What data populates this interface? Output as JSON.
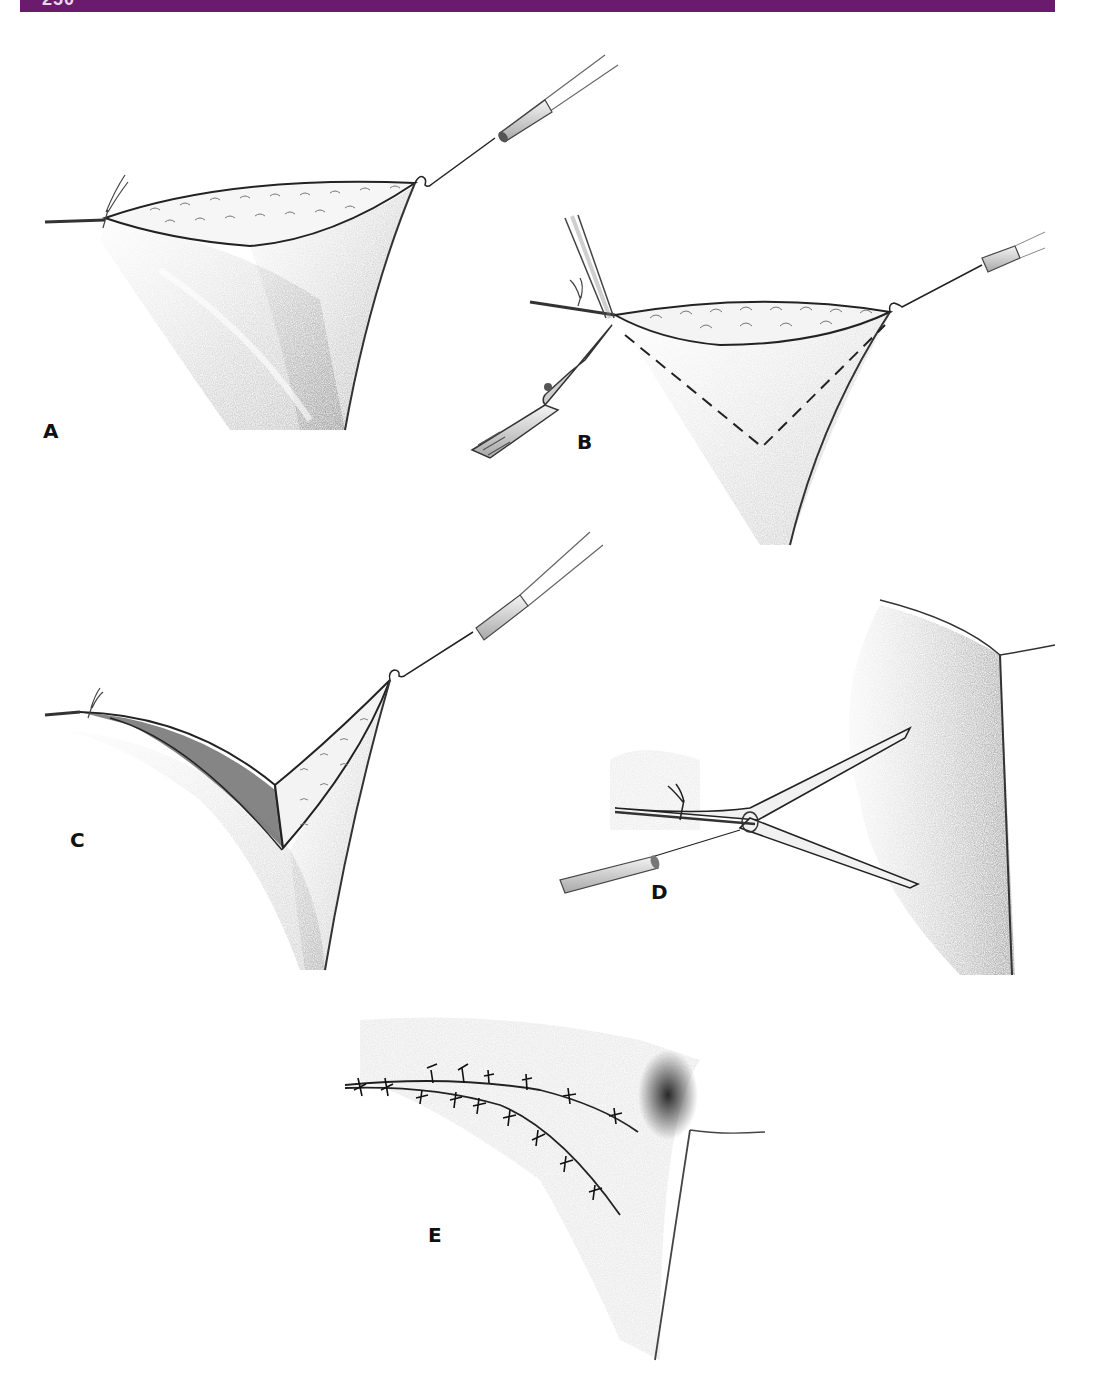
{
  "page": {
    "header": {
      "page_number": "250",
      "bar_color": "#6a1b6e"
    }
  },
  "figure": {
    "type": "surgical-illustration",
    "style": "pencil shading, grayscale",
    "panels": [
      {
        "id": "A",
        "label": "A",
        "description": "Incision opened and retracted upward by a single skin hook; suture tie at left end of wound"
      },
      {
        "id": "B",
        "label": "B",
        "description": "Forceps grasp wound edge while a scalpel incises along a dashed V-shaped line marking the excision"
      },
      {
        "id": "C",
        "label": "C",
        "description": "V-shaped wedge of tissue raised with skin hook, exposing the underlying wound bed"
      },
      {
        "id": "D",
        "label": "D",
        "description": "Flap rotated; Y-shaped incision with skin hook at left and suture tie; shaded adjacent contour at right"
      },
      {
        "id": "E",
        "label": "E",
        "description": "Closed wound with two curved rows of interrupted sutures converging toward the shaded contour"
      }
    ],
    "instruments": [
      "skin-hook",
      "forceps",
      "scalpel",
      "suture"
    ],
    "colors": {
      "ink": "#1a1a1a",
      "shade": "#8a8a8a",
      "background": "#ffffff"
    }
  }
}
